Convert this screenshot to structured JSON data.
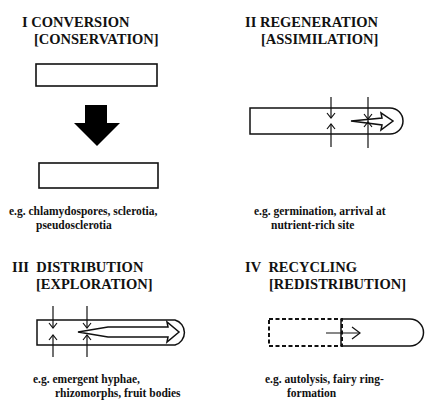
{
  "panels": [
    {
      "numeral": "I",
      "title": "CONVERSION",
      "subtitle": "[CONSERVATION]",
      "caption_line1": "e.g. chlamydospores, sclerotia,",
      "caption_line2": "pseudosclerotia",
      "diagram": "box-to-box-transformation"
    },
    {
      "numeral": "II",
      "title": "REGENERATION",
      "subtitle": "[ASSIMILATION]",
      "caption_line1": "e.g. germination, arrival at",
      "caption_line2": "nutrient-rich site",
      "diagram": "hypha-with-inward-uptake-arrows"
    },
    {
      "numeral": "III",
      "title": "DISTRIBUTION",
      "subtitle": "[EXPLORATION]",
      "caption_line1": "e.g. emergent hyphae,",
      "caption_line2": "rhizomorphs, fruit bodies",
      "diagram": "hypha-with-long-translocation-arrow"
    },
    {
      "numeral": "IV",
      "title": "RECYCLING",
      "subtitle": "[REDISTRIBUTION]",
      "caption_line1": "e.g. autolysis, fairy ring-",
      "caption_line2": "formation",
      "diagram": "hypha-with-dashed-autolysed-region"
    }
  ],
  "colors": {
    "ink": "#111111",
    "background": "#ffffff"
  }
}
